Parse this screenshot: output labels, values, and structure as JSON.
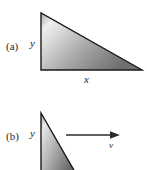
{
  "figure": {
    "background_color": "#ffffff",
    "stroke_color": "#1a1a1a",
    "panels": [
      {
        "id": "a",
        "panel_label": "(a)",
        "shape": "right-triangle",
        "vertical_axis_label": "y",
        "horizontal_axis_label": "x",
        "vertices": [
          [
            41,
            13
          ],
          [
            41,
            70
          ],
          [
            142,
            70
          ]
        ],
        "gradient": {
          "light": "#f2f2f2",
          "mid": "#b8b8b8",
          "dark": "#6f6f6f"
        }
      },
      {
        "id": "b",
        "panel_label": "(b)",
        "shape": "right-triangle",
        "vertical_axis_label": "y",
        "velocity_label": "v",
        "vertices": [
          [
            41,
            113
          ],
          [
            41,
            170
          ],
          [
            74,
            170
          ]
        ],
        "gradient": {
          "light": "#ececec",
          "mid": "#b0b0b0",
          "dark": "#6a6a6a"
        },
        "arrow": {
          "name": "velocity-arrow",
          "x_start": 66,
          "x_end": 120,
          "y": 135,
          "color": "#2b2b2b"
        }
      }
    ]
  }
}
